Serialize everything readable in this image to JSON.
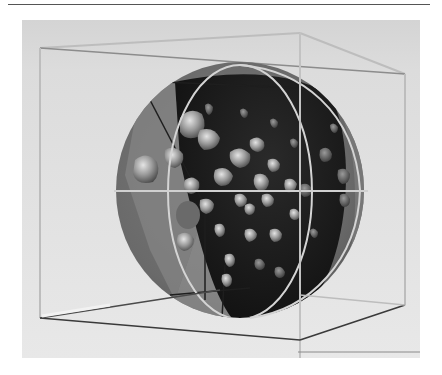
{
  "figure": {
    "colors": {
      "page_background": "#ffffff",
      "panel_background": "#d9d9d9",
      "panel_background_light": "#e6e6e6",
      "sphere_outer": "#6e6e6e",
      "sphere_inner_dark": "#1c1c1c",
      "sphere_mid": "#8a8a8a",
      "box_line_light": "#bdbdbd",
      "box_line_dark": "#3a3a3a",
      "meridian_ring": "#d8d8d8",
      "blob_highlight": "#c8c8c8",
      "blob_shadow": "#5a5a5a"
    },
    "box": {
      "top_left": [
        40,
        48
      ],
      "top_back": [
        300,
        33
      ],
      "top_right": [
        405,
        74
      ],
      "bottom_left": [
        40,
        318
      ],
      "bottom_front": [
        300,
        340
      ],
      "bottom_right": [
        405,
        305
      ]
    },
    "sphere": {
      "cx": 240,
      "cy": 190,
      "rx": 124,
      "ry": 128
    },
    "blob_count": 46
  }
}
